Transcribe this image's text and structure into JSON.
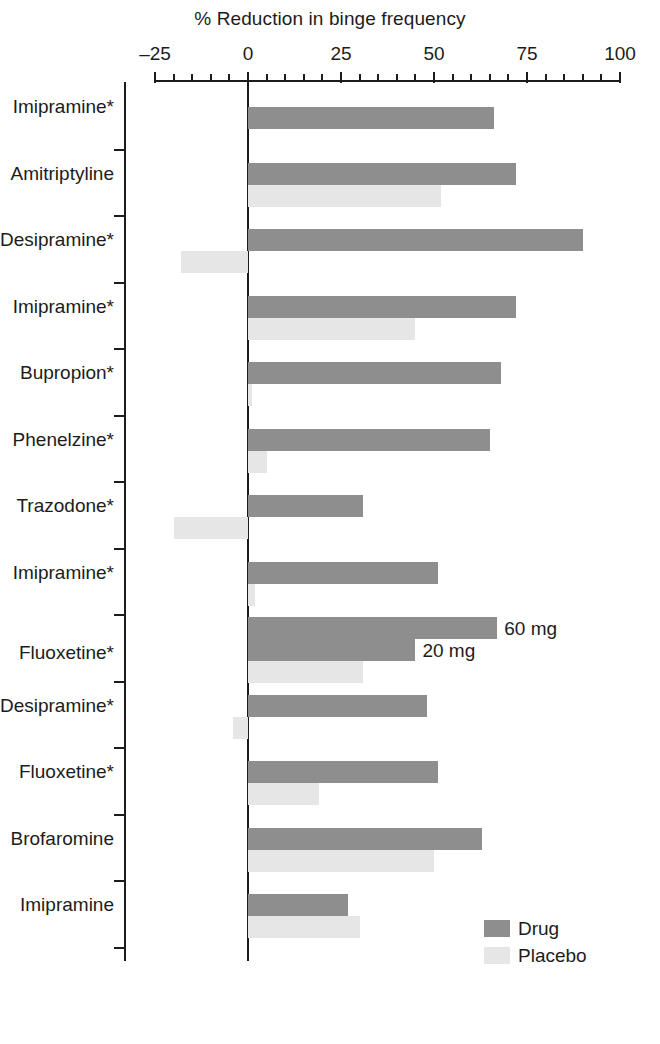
{
  "chart_data": {
    "type": "bar",
    "orientation": "horizontal",
    "title": "% Reduction in binge frequency",
    "xlabel": "% Reduction in binge frequency",
    "ylabel": "",
    "xlim": [
      -25,
      100
    ],
    "xticks": [
      -25,
      0,
      25,
      50,
      75,
      100
    ],
    "xtick_labels": [
      "–25",
      "0",
      "25",
      "50",
      "75",
      "100"
    ],
    "minor_tick_step": 5,
    "grid": false,
    "legend_position": "bottom-right",
    "series": [
      {
        "name": "Drug",
        "color": "#8e8e8e"
      },
      {
        "name": "Placebo",
        "color": "#e6e6e6"
      }
    ],
    "categories": [
      "Imipramine*",
      "Amitriptyline",
      "Desipramine*",
      "Imipramine*",
      "Bupropion*",
      "Phenelzine*",
      "Trazodone*",
      "Imipramine*",
      "Fluoxetine*",
      "Desipramine*",
      "Fluoxetine*",
      "Brofaromine",
      "Imipramine"
    ],
    "rows": [
      {
        "category": "Imipramine*",
        "drug": 66,
        "placebo": null,
        "note": ""
      },
      {
        "category": "Amitriptyline",
        "drug": 72,
        "placebo": 52,
        "note": ""
      },
      {
        "category": "Desipramine*",
        "drug": 90,
        "placebo": -18,
        "note": ""
      },
      {
        "category": "Imipramine*",
        "drug": 72,
        "placebo": 45,
        "note": ""
      },
      {
        "category": "Bupropion*",
        "drug": 68,
        "placebo": 1,
        "note": ""
      },
      {
        "category": "Phenelzine*",
        "drug": 65,
        "placebo": 5,
        "note": ""
      },
      {
        "category": "Trazodone*",
        "drug": 31,
        "placebo": -20,
        "note": ""
      },
      {
        "category": "Imipramine*",
        "drug": 51,
        "placebo": 2,
        "note": ""
      },
      {
        "category": "Fluoxetine*",
        "drug": 67,
        "drug2": 45,
        "placebo": 31,
        "note": "60 mg",
        "note2": "20 mg"
      },
      {
        "category": "Desipramine*",
        "drug": 48,
        "placebo": -4,
        "note": ""
      },
      {
        "category": "Fluoxetine*",
        "drug": 51,
        "placebo": 19,
        "note": ""
      },
      {
        "category": "Brofaromine",
        "drug": 63,
        "placebo": 50,
        "note": ""
      },
      {
        "category": "Imipramine",
        "drug": 27,
        "placebo": 30,
        "note": ""
      }
    ]
  },
  "legend": {
    "items": [
      {
        "label": "Drug",
        "color": "#8e8e8e"
      },
      {
        "label": "Placebo",
        "color": "#e6e6e6"
      }
    ]
  }
}
